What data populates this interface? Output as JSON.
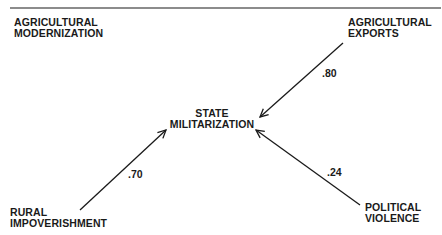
{
  "diagram": {
    "type": "path-diagram",
    "nodes": {
      "agricultural_modernization": {
        "line1": "AGRICULTURAL",
        "line2": "MODERNIZATION"
      },
      "agricultural_exports": {
        "line1": "AGRICULTURAL",
        "line2": "EXPORTS"
      },
      "state_militarization": {
        "line1": "STATE",
        "line2": "MILITARIZATION"
      },
      "rural_impoverishment": {
        "line1": "RURAL",
        "line2": "IMPOVERISHMENT"
      },
      "political_violence": {
        "line1": "POLITICAL",
        "line2": "VIOLENCE"
      }
    },
    "edges": [
      {
        "from": "agricultural_exports",
        "to": "state_militarization",
        "coefficient": ".80"
      },
      {
        "from": "rural_impoverishment",
        "to": "state_militarization",
        "coefficient": ".70"
      },
      {
        "from": "political_violence",
        "to": "state_militarization",
        "coefficient": ".24"
      }
    ],
    "colors": {
      "ink": "#1a1a1a",
      "background": "#ffffff"
    }
  }
}
